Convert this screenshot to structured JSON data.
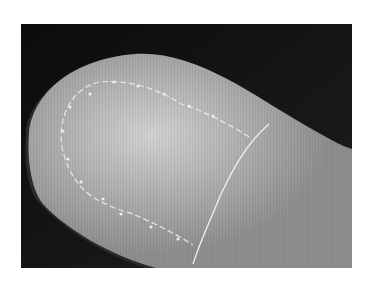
{
  "image": {
    "subject": "rounded object surface with dashed stitched outline and curved seam line",
    "background_color": "#ffffff",
    "backdrop_color": "#141414",
    "surface_color": "#a8a8a8",
    "highlight_color": "#d0d0d0",
    "line_color": "#e6e6e6"
  }
}
